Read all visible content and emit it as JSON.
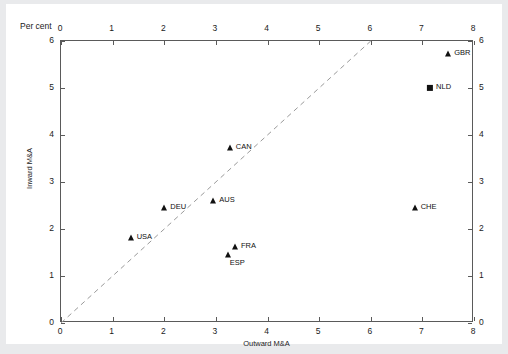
{
  "chart_data": {
    "type": "scatter",
    "title": "",
    "unit_label": "Per cent",
    "xlabel": "Outward M&A",
    "ylabel": "Inward M&A",
    "xlim": [
      0,
      8
    ],
    "ylim": [
      0,
      6
    ],
    "xticks": [
      0,
      1,
      2,
      3,
      4,
      5,
      6,
      7,
      8
    ],
    "yticks": [
      0,
      1,
      2,
      3,
      4,
      5,
      6
    ],
    "xtick_labels": [
      "0",
      "1",
      "2",
      "3",
      "4",
      "5",
      "6",
      "7",
      "8"
    ],
    "ytick_labels": [
      "0",
      "1",
      "2",
      "3",
      "4",
      "5",
      "6"
    ],
    "grid": false,
    "legend": "none",
    "top_axis": true,
    "right_axis": true,
    "reference_line": {
      "style": "dashed",
      "from": [
        0,
        0
      ],
      "to": [
        6,
        6
      ],
      "description": "45-degree parity line"
    },
    "points": [
      {
        "label": "GBR",
        "x": 7.5,
        "y": 5.72,
        "marker": "triangle",
        "label_dx": 6,
        "label_dy": -1
      },
      {
        "label": "NLD",
        "x": 7.15,
        "y": 5.0,
        "marker": "square",
        "label_dx": 6,
        "label_dy": -1
      },
      {
        "label": "CAN",
        "x": 3.27,
        "y": 3.72,
        "marker": "triangle",
        "label_dx": 6,
        "label_dy": -1
      },
      {
        "label": "AUS",
        "x": 2.95,
        "y": 2.6,
        "marker": "triangle",
        "label_dx": 6,
        "label_dy": -1
      },
      {
        "label": "CHE",
        "x": 6.85,
        "y": 2.45,
        "marker": "triangle",
        "label_dx": 6,
        "label_dy": -1
      },
      {
        "label": "DEU",
        "x": 2.0,
        "y": 2.45,
        "marker": "triangle",
        "label_dx": 6,
        "label_dy": -1
      },
      {
        "label": "USA",
        "x": 1.35,
        "y": 1.8,
        "marker": "triangle",
        "label_dx": 6,
        "label_dy": -1
      },
      {
        "label": "FRA",
        "x": 3.37,
        "y": 1.62,
        "marker": "triangle",
        "label_dx": 6,
        "label_dy": -1
      },
      {
        "label": "ESP",
        "x": 3.23,
        "y": 1.45,
        "marker": "triangle",
        "label_dx": 2,
        "label_dy": 8
      }
    ]
  },
  "colors": {
    "marker": "#111111",
    "axis": "#5a5a5a",
    "text": "#1b1b1b",
    "reference_line": "#9a9a9a",
    "plot_background": "#ffffff",
    "page_background": "#e9eaec"
  }
}
